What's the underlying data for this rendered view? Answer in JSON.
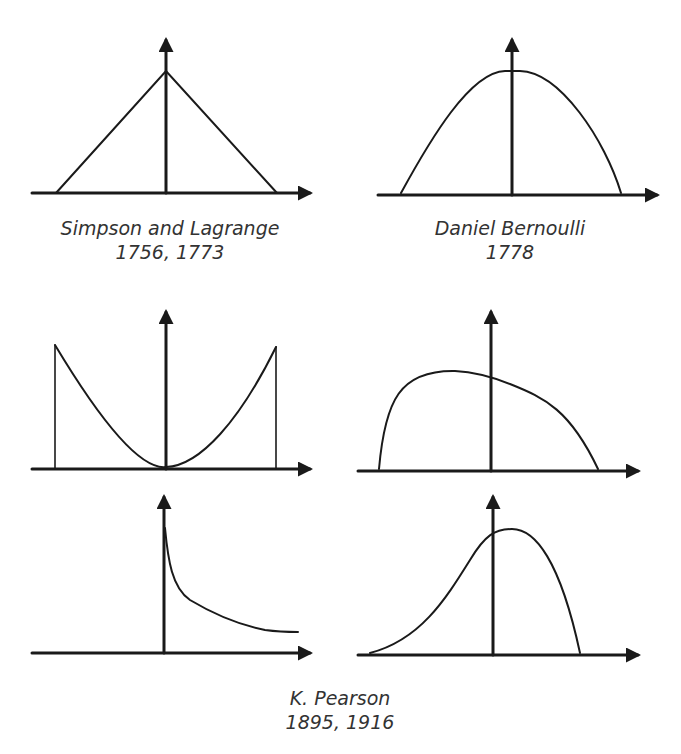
{
  "diagram": {
    "panels": [
      {
        "id": "simpson-lagrange",
        "shape": "triangular",
        "caption": {
          "name": "Simpson and Lagrange",
          "years": "1756, 1773"
        }
      },
      {
        "id": "bernoulli",
        "shape": "semicircular / parabolic",
        "caption": {
          "name": "Daniel Bernoulli",
          "years": "1778"
        }
      },
      {
        "id": "pearson-u",
        "shape": "U-shaped",
        "caption": null
      },
      {
        "id": "pearson-skew-left",
        "shape": "skewed hump",
        "caption": null
      },
      {
        "id": "pearson-j",
        "shape": "J-shaped / decaying",
        "caption": null
      },
      {
        "id": "pearson-skew-right",
        "shape": "left-tailed hump",
        "caption": null
      }
    ],
    "pearson_caption": {
      "name": "K. Pearson",
      "years": "1895, 1916"
    },
    "colors": {
      "stroke": "#1a1a1a",
      "text": "#333333",
      "background": "#ffffff"
    }
  }
}
